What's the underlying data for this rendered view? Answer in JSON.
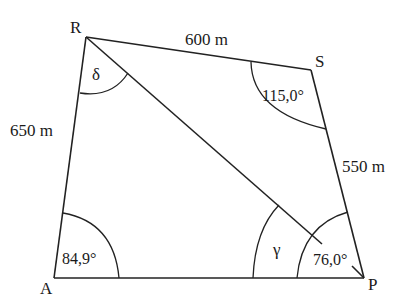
{
  "diagram": {
    "type": "quadrilateral",
    "vertices": {
      "R": {
        "label": "R"
      },
      "S": {
        "label": "S"
      },
      "P": {
        "label": "P"
      },
      "A": {
        "label": "A"
      }
    },
    "sides": {
      "RS": {
        "label": "600 m"
      },
      "SP": {
        "label": "550 m"
      },
      "AR": {
        "label": "650 m"
      },
      "AP": {
        "label": ""
      },
      "RP": {
        "label": "",
        "kind": "diagonal"
      }
    },
    "angles": {
      "R": {
        "label": "δ"
      },
      "S": {
        "label": "115,0°"
      },
      "A": {
        "label": "84,9°"
      },
      "P_gamma": {
        "label": "γ"
      },
      "P_full": {
        "label": "76,0°"
      }
    }
  }
}
